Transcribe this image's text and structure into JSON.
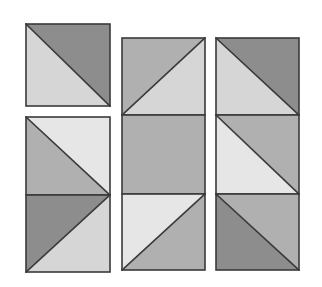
{
  "figure": {
    "background_color": "#ffffff",
    "outline_color": "#3a3a3a",
    "outline_width": 1.6,
    "canvas": {
      "width": 322,
      "height": 287
    },
    "palette": {
      "dark_gray": "#8d8d8d",
      "medium_gray": "#b0b0b0",
      "light_gray": "#d6d6d6",
      "pale_gray": "#e6e6e6"
    },
    "columns": [
      {
        "name": "left-column",
        "x": 26,
        "width": 84,
        "tiles": [
          {
            "name": "left-tile-1",
            "y": 24,
            "height": 82,
            "split": "main-diagonal",
            "halves": [
              {
                "position": "upper-right",
                "color": "#8d8d8d",
                "tone": "dark_gray"
              },
              {
                "position": "lower-left",
                "color": "#d6d6d6",
                "tone": "light_gray"
              }
            ]
          },
          {
            "name": "left-tile-2",
            "y": 117,
            "height": 78,
            "split": "main-diagonal",
            "halves": [
              {
                "position": "upper-right",
                "color": "#e6e6e6",
                "tone": "pale_gray"
              },
              {
                "position": "lower-left",
                "color": "#b0b0b0",
                "tone": "medium_gray"
              }
            ]
          },
          {
            "name": "left-tile-3",
            "y": 195,
            "height": 77,
            "split": "anti-diagonal",
            "halves": [
              {
                "position": "upper-left",
                "color": "#8d8d8d",
                "tone": "dark_gray"
              },
              {
                "position": "lower-right",
                "color": "#d6d6d6",
                "tone": "light_gray"
              }
            ]
          }
        ]
      },
      {
        "name": "middle-column",
        "x": 122,
        "width": 83,
        "tiles": [
          {
            "name": "middle-tile-1",
            "y": 38,
            "height": 77,
            "split": "anti-diagonal",
            "halves": [
              {
                "position": "upper-left",
                "color": "#b0b0b0",
                "tone": "medium_gray"
              },
              {
                "position": "lower-right",
                "color": "#d6d6d6",
                "tone": "light_gray"
              }
            ]
          },
          {
            "name": "middle-tile-2",
            "y": 115,
            "height": 79,
            "split": "none",
            "halves": [
              {
                "position": "whole",
                "color": "#b0b0b0",
                "tone": "medium_gray"
              }
            ]
          },
          {
            "name": "middle-tile-3",
            "y": 194,
            "height": 76,
            "split": "anti-diagonal",
            "halves": [
              {
                "position": "upper-left",
                "color": "#e6e6e6",
                "tone": "pale_gray"
              },
              {
                "position": "lower-right",
                "color": "#b0b0b0",
                "tone": "medium_gray"
              }
            ]
          }
        ]
      },
      {
        "name": "right-column",
        "x": 216,
        "width": 83,
        "tiles": [
          {
            "name": "right-tile-1",
            "y": 38,
            "height": 77,
            "split": "main-diagonal",
            "halves": [
              {
                "position": "upper-right",
                "color": "#8d8d8d",
                "tone": "dark_gray"
              },
              {
                "position": "lower-left",
                "color": "#d6d6d6",
                "tone": "light_gray"
              }
            ]
          },
          {
            "name": "right-tile-2",
            "y": 115,
            "height": 79,
            "split": "anti-diagonal",
            "halves": [
              {
                "position": "upper-right",
                "color": "#b0b0b0",
                "tone": "medium_gray"
              },
              {
                "position": "lower-left",
                "color": "#e6e6e6",
                "tone": "pale_gray"
              }
            ]
          },
          {
            "name": "right-tile-3",
            "y": 194,
            "height": 76,
            "split": "main-diagonal",
            "halves": [
              {
                "position": "upper-right",
                "color": "#b0b0b0",
                "tone": "medium_gray"
              },
              {
                "position": "lower-left",
                "color": "#8d8d8d",
                "tone": "dark_gray"
              }
            ]
          }
        ]
      }
    ]
  }
}
